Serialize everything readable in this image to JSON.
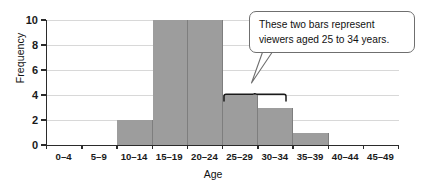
{
  "chart_data": {
    "type": "bar",
    "title": "",
    "subtitle": "",
    "xlabel": "Age",
    "ylabel": "Frequency",
    "categories": [
      "0–4",
      "5–9",
      "10–14",
      "15–19",
      "20–24",
      "25–29",
      "30–34",
      "35–39",
      "40–44",
      "45–49"
    ],
    "values": [
      0,
      0,
      2,
      10,
      10,
      4,
      3,
      1,
      0,
      0
    ],
    "ylim": [
      0,
      10
    ],
    "yticks": [
      0,
      2,
      4,
      6,
      8,
      10
    ],
    "ytick_labels": [
      "0",
      "2",
      "4",
      "6",
      "8",
      "10"
    ],
    "grid": "horizontal",
    "legend": "none",
    "bar_color": "#9d9d9d",
    "axis_color": "#2b2b2b",
    "grid_color": "#d8d8d8",
    "annotations": [
      {
        "name": "callout",
        "text": "These two bars represent viewers aged 25 to 34 years.",
        "points_to": [
          "25–29",
          "30–34"
        ],
        "shape": "rounded-rectangle-with-tail"
      },
      {
        "name": "bracket",
        "spans": [
          "25–29",
          "30–34"
        ]
      }
    ]
  },
  "axes": {
    "y_title": "Frequency",
    "x_title": "Age"
  },
  "callout": {
    "line1": "These two bars represent",
    "line2": "viewers aged 25 to 34 years."
  }
}
